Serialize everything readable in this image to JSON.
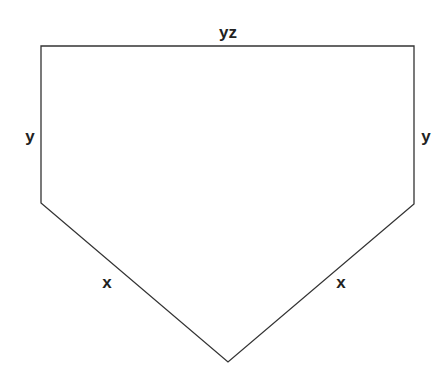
{
  "diagram": {
    "shape": "pentagon",
    "stroke_color": "#333333",
    "vertices": [
      [
        41,
        46
      ],
      [
        414,
        46
      ],
      [
        414,
        204
      ],
      [
        228,
        362
      ],
      [
        41,
        203
      ]
    ],
    "labels": {
      "top": "yz",
      "left": "y",
      "right": "y",
      "lower_left": "x",
      "lower_right": "x"
    }
  }
}
